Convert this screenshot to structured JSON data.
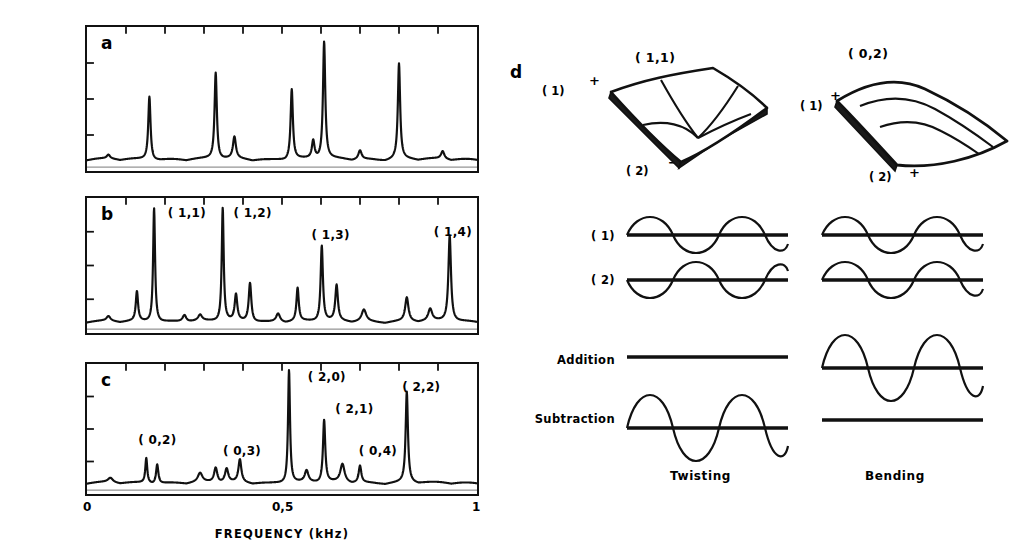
{
  "figure": {
    "axis": {
      "ylabel": "SPECTRUM INTENSITY (arbitrary units)",
      "xlabel": "FREQUENCY (kHz)",
      "xticks": [
        "0",
        "0,5",
        "1"
      ]
    }
  },
  "chart_data": [
    {
      "type": "line",
      "panel": "a",
      "title": "a",
      "xlabel": "FREQUENCY (kHz)",
      "ylabel": "SPECTRUM INTENSITY (arbitrary units)",
      "xlim": [
        0,
        1
      ],
      "ylim": [
        0,
        1
      ],
      "grid": false,
      "xtick_values": [
        0,
        0.5,
        1
      ],
      "xtick_labels": [
        "0",
        "0,5",
        "1"
      ],
      "peaks": [
        {
          "x": 0.055,
          "height": 0.03,
          "width": 0.01,
          "label": ""
        },
        {
          "x": 0.16,
          "height": 0.5,
          "width": 0.007,
          "label": ""
        },
        {
          "x": 0.33,
          "height": 0.68,
          "width": 0.007,
          "label": ""
        },
        {
          "x": 0.378,
          "height": 0.17,
          "width": 0.009,
          "label": ""
        },
        {
          "x": 0.525,
          "height": 0.55,
          "width": 0.007,
          "label": ""
        },
        {
          "x": 0.58,
          "height": 0.14,
          "width": 0.008,
          "label": ""
        },
        {
          "x": 0.608,
          "height": 0.92,
          "width": 0.007,
          "label": ""
        },
        {
          "x": 0.7,
          "height": 0.07,
          "width": 0.01,
          "label": ""
        },
        {
          "x": 0.8,
          "height": 0.75,
          "width": 0.007,
          "label": ""
        },
        {
          "x": 0.912,
          "height": 0.06,
          "width": 0.01,
          "label": ""
        }
      ],
      "labels": []
    },
    {
      "type": "line",
      "panel": "b",
      "title": "b",
      "xlabel": "FREQUENCY (kHz)",
      "ylabel": "SPECTRUM INTENSITY (arbitrary units)",
      "xlim": [
        0,
        1
      ],
      "ylim": [
        0,
        1
      ],
      "grid": false,
      "peaks": [
        {
          "x": 0.055,
          "height": 0.04,
          "width": 0.012
        },
        {
          "x": 0.128,
          "height": 0.25,
          "width": 0.007
        },
        {
          "x": 0.172,
          "height": 0.97,
          "width": 0.006
        },
        {
          "x": 0.25,
          "height": 0.06,
          "width": 0.012
        },
        {
          "x": 0.29,
          "height": 0.05,
          "width": 0.012
        },
        {
          "x": 0.348,
          "height": 0.96,
          "width": 0.006
        },
        {
          "x": 0.382,
          "height": 0.22,
          "width": 0.008
        },
        {
          "x": 0.418,
          "height": 0.33,
          "width": 0.008
        },
        {
          "x": 0.49,
          "height": 0.07,
          "width": 0.012
        },
        {
          "x": 0.54,
          "height": 0.28,
          "width": 0.007
        },
        {
          "x": 0.602,
          "height": 0.64,
          "width": 0.007
        },
        {
          "x": 0.64,
          "height": 0.3,
          "width": 0.008
        },
        {
          "x": 0.71,
          "height": 0.1,
          "width": 0.014
        },
        {
          "x": 0.82,
          "height": 0.2,
          "width": 0.01
        },
        {
          "x": 0.88,
          "height": 0.1,
          "width": 0.012
        },
        {
          "x": 0.93,
          "height": 0.73,
          "width": 0.008
        }
      ],
      "labels": [
        {
          "text": "( 1,1)",
          "x": 0.205,
          "y": 0.92
        },
        {
          "text": "( 1,2)",
          "x": 0.372,
          "y": 0.92
        },
        {
          "text": "( 1,3)",
          "x": 0.57,
          "y": 0.74
        },
        {
          "text": "( 1,4)",
          "x": 0.88,
          "y": 0.76
        }
      ]
    },
    {
      "type": "line",
      "panel": "c",
      "title": "c",
      "xlabel": "FREQUENCY (kHz)",
      "ylabel": "SPECTRUM INTENSITY (arbitrary units)",
      "xlim": [
        0,
        1
      ],
      "ylim": [
        0,
        1
      ],
      "grid": false,
      "peaks": [
        {
          "x": 0.06,
          "height": 0.04,
          "width": 0.015
        },
        {
          "x": 0.152,
          "height": 0.22,
          "width": 0.006
        },
        {
          "x": 0.18,
          "height": 0.17,
          "width": 0.007
        },
        {
          "x": 0.29,
          "height": 0.08,
          "width": 0.014
        },
        {
          "x": 0.33,
          "height": 0.13,
          "width": 0.01
        },
        {
          "x": 0.358,
          "height": 0.12,
          "width": 0.01
        },
        {
          "x": 0.392,
          "height": 0.2,
          "width": 0.009
        },
        {
          "x": 0.518,
          "height": 1.0,
          "width": 0.006
        },
        {
          "x": 0.563,
          "height": 0.1,
          "width": 0.011
        },
        {
          "x": 0.608,
          "height": 0.55,
          "width": 0.007
        },
        {
          "x": 0.655,
          "height": 0.16,
          "width": 0.013
        },
        {
          "x": 0.7,
          "height": 0.15,
          "width": 0.008
        },
        {
          "x": 0.82,
          "height": 0.8,
          "width": 0.007
        }
      ],
      "labels": [
        {
          "text": "( 0,2)",
          "x": 0.13,
          "y": 0.39
        },
        {
          "text": "( 0,3)",
          "x": 0.345,
          "y": 0.3
        },
        {
          "text": "( 2,0)",
          "x": 0.56,
          "y": 0.93
        },
        {
          "text": "( 2,1)",
          "x": 0.63,
          "y": 0.66
        },
        {
          "text": "( 0,4)",
          "x": 0.69,
          "y": 0.3
        },
        {
          "text": "( 2,2)",
          "x": 0.8,
          "y": 0.85
        }
      ]
    }
  ],
  "panel_d": {
    "letter": "d",
    "columns": [
      {
        "key": "twisting",
        "caption": "Twisting",
        "mode_label": "( 1,1)",
        "edge_labels": [
          {
            "name": "(1)",
            "text": "( 1)",
            "sign": "+"
          },
          {
            "name": "(2)",
            "text": "( 2)",
            "sign": "−"
          }
        ],
        "waves": {
          "w1": "sine",
          "w2": "inverted-sine",
          "addition": "flat",
          "subtraction": "large-sine"
        }
      },
      {
        "key": "bending",
        "caption": "Bending",
        "mode_label": "( 0,2)",
        "edge_labels": [
          {
            "name": "(1)",
            "text": "( 1)",
            "sign": "+"
          },
          {
            "name": "(2)",
            "text": "( 2)",
            "sign": "+"
          }
        ],
        "waves": {
          "w1": "sine",
          "w2": "sine",
          "addition": "large-sine",
          "subtraction": "flat"
        }
      }
    ],
    "row_labels": [
      "( 1)",
      "( 2)",
      "Addition",
      "Subtraction"
    ]
  },
  "colors": {
    "ink": "#111111",
    "background": "#ffffff"
  }
}
